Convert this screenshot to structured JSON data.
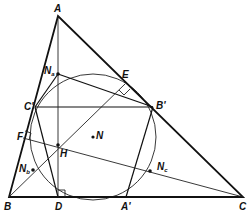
{
  "figure": {
    "type": "geometry-diagram",
    "caption": ""
  },
  "points": {
    "A": {
      "label": "A",
      "x": 58,
      "y": 16
    },
    "B": {
      "label": "B",
      "x": 9,
      "y": 197
    },
    "C": {
      "label": "C",
      "x": 243,
      "y": 197
    },
    "A1": {
      "label": "A'",
      "x": 126,
      "y": 197
    },
    "B1": {
      "label": "B'",
      "x": 153,
      "y": 107
    },
    "C1": {
      "label": "C'",
      "x": 35,
      "y": 107
    },
    "D": {
      "label": "D",
      "x": 58,
      "y": 197
    },
    "E": {
      "label": "E",
      "x": 125,
      "y": 84
    },
    "F": {
      "label": "F",
      "x": 23,
      "y": 138
    },
    "H": {
      "label": "H",
      "x": 58,
      "y": 145
    },
    "N": {
      "label": "N",
      "x": 93,
      "y": 137
    },
    "Na": {
      "label": "N",
      "sub": "a",
      "x": 58,
      "y": 74
    },
    "Nb": {
      "label": "N",
      "sub": "b",
      "x": 33,
      "y": 170
    },
    "Nc": {
      "label": "N",
      "sub": "c",
      "x": 150,
      "y": 171
    }
  },
  "nine_point_circle": {
    "cx": 93,
    "cy": 137,
    "r": 63
  },
  "colors": {
    "ink": "#111111",
    "background": "#ffffff"
  }
}
